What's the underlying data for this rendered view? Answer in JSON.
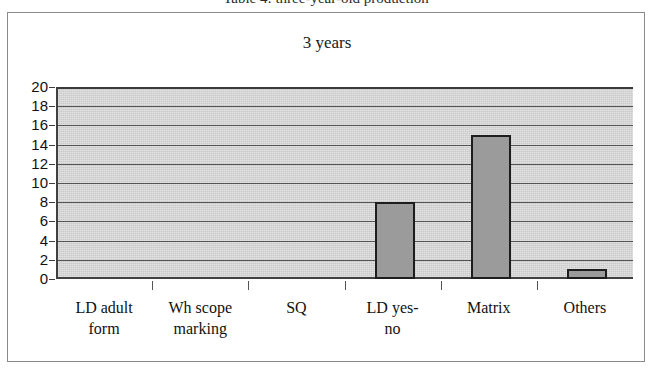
{
  "caption": "Table 4: three-year-old production",
  "frame": {},
  "chart_data": {
    "type": "bar",
    "title": "3 years",
    "xlabel": "",
    "ylabel": "",
    "categories": [
      "LD adult form",
      "Wh scope marking",
      "SQ",
      "LD yes-no",
      "Matrix",
      "Others"
    ],
    "category_lines": [
      [
        "LD adult",
        "form"
      ],
      [
        "Wh scope",
        "marking"
      ],
      [
        "SQ",
        ""
      ],
      [
        "LD yes-",
        "no"
      ],
      [
        "Matrix",
        ""
      ],
      [
        "Others",
        ""
      ]
    ],
    "values": [
      0,
      0,
      0,
      8,
      15,
      1
    ],
    "ylim": [
      0,
      20
    ],
    "yticks": [
      20,
      18,
      16,
      14,
      12,
      10,
      8,
      6,
      4,
      2,
      0
    ],
    "ytick_step": 2,
    "grid": true,
    "legend": "none",
    "colors": {
      "bar_fill": "#9b9b9b",
      "bar_border": "#1d1d1d",
      "plot_background": "#c9c9c9",
      "gridline": "#555555",
      "axis": "#404040",
      "text": "#111111"
    }
  }
}
